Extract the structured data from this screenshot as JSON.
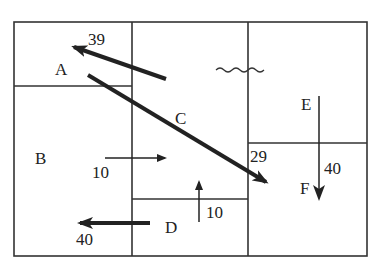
{
  "diagram": {
    "regions": [
      {
        "id": "A",
        "label": "A"
      },
      {
        "id": "B",
        "label": "B"
      },
      {
        "id": "C",
        "label": "C"
      },
      {
        "id": "D",
        "label": "D"
      },
      {
        "id": "E",
        "label": "E"
      },
      {
        "id": "F",
        "label": "F"
      }
    ],
    "flows": [
      {
        "from": "C",
        "to": "A",
        "value": "39"
      },
      {
        "from": "A",
        "to": "F",
        "value": "29"
      },
      {
        "from": "B",
        "to": "C",
        "value": "10"
      },
      {
        "from": "D",
        "to": "C",
        "value": "10"
      },
      {
        "from": "D",
        "to": "B",
        "value": "40"
      },
      {
        "from": "E",
        "to": "F",
        "value": "40"
      }
    ],
    "symbol": "wavy-line",
    "colors": {
      "line": "#333333",
      "arrow": "#222222",
      "background": "#ffffff"
    }
  }
}
